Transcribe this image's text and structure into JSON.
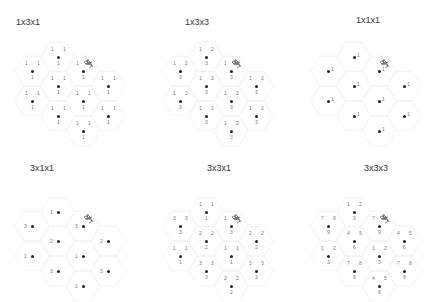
{
  "figure": {
    "panels": [
      {
        "id": "p1",
        "title": "1x3x1",
        "origin": [
          0,
          0
        ],
        "title_pos": [
          16,
          17
        ],
        "labels": [
          {
            "dot": 0,
            "top": [
              "1",
              "1"
            ],
            "bottom": [
              "1"
            ]
          },
          {
            "dot": 1,
            "top": [
              "1",
              "1"
            ],
            "bottom": [
              "1"
            ]
          },
          {
            "dot": 2,
            "top": [
              "1",
              "1"
            ],
            "bottom": [
              "1"
            ]
          },
          {
            "dot": 3,
            "top": [
              "1",
              "1"
            ],
            "bottom": [
              "1"
            ]
          },
          {
            "dot": 4,
            "top": [
              "1",
              "1"
            ],
            "bottom": [
              "1"
            ]
          },
          {
            "dot": 5,
            "top": [
              "1",
              "1"
            ],
            "bottom": [
              "1"
            ]
          },
          {
            "dot": 6,
            "top": [
              "1",
              "1"
            ],
            "bottom": [
              "1"
            ]
          },
          {
            "dot": 7,
            "top": [
              "1",
              "1"
            ],
            "bottom": [
              "1"
            ]
          },
          {
            "dot": 8,
            "top": [
              "1",
              "1"
            ],
            "bottom": [
              "1"
            ]
          },
          {
            "dot": 9,
            "top": [
              "1",
              "1"
            ],
            "bottom": [
              "1"
            ]
          }
        ]
      },
      {
        "id": "p2",
        "title": "1x3x3",
        "origin": [
          148,
          0
        ],
        "title_pos": [
          37,
          17
        ],
        "labels": [
          {
            "dot": 0,
            "top": [
              "1",
              "2"
            ],
            "bottom": [
              "3"
            ]
          },
          {
            "dot": 1,
            "top": [
              "1",
              "2"
            ],
            "bottom": [
              "3"
            ]
          },
          {
            "dot": 2,
            "top": [
              "1",
              "2"
            ],
            "bottom": [
              "3"
            ]
          },
          {
            "dot": 3,
            "top": [
              "1",
              "2"
            ],
            "bottom": [
              "3"
            ]
          },
          {
            "dot": 4,
            "top": [
              "1",
              "2"
            ],
            "bottom": [
              "3"
            ]
          },
          {
            "dot": 5,
            "top": [
              "1",
              "2"
            ],
            "bottom": [
              "3"
            ]
          },
          {
            "dot": 6,
            "top": [
              "1",
              "2"
            ],
            "bottom": [
              "3"
            ]
          },
          {
            "dot": 7,
            "top": [
              "1",
              "2"
            ],
            "bottom": [
              "3"
            ]
          },
          {
            "dot": 8,
            "top": [
              "1",
              "2"
            ],
            "bottom": [
              "3"
            ]
          },
          {
            "dot": 9,
            "top": [
              "1",
              "2"
            ],
            "bottom": [
              "3"
            ]
          }
        ]
      },
      {
        "id": "p3",
        "title": "1x1x1",
        "origin": [
          296,
          0
        ],
        "title_pos": [
          60,
          15
        ],
        "labels": [
          {
            "dot": 0,
            "side_right": "1"
          },
          {
            "dot": 1,
            "side_right": "1"
          },
          {
            "dot": 2,
            "side_right": "1"
          },
          {
            "dot": 3,
            "side_right": "1"
          },
          {
            "dot": 4,
            "side_right": "1"
          },
          {
            "dot": 5,
            "side_right": "1"
          },
          {
            "dot": 6,
            "side_right": "1"
          },
          {
            "dot": 7,
            "side_right": "1"
          },
          {
            "dot": 8,
            "side_right": "1"
          },
          {
            "dot": 9,
            "side_right": "1"
          }
        ]
      },
      {
        "id": "p4",
        "title": "3x1x1",
        "origin": [
          0,
          150
        ],
        "title_pos": [
          30,
          13
        ],
        "labels": [
          {
            "dot": 0,
            "side_left": "1"
          },
          {
            "dot": 1,
            "side_left": "3"
          },
          {
            "dot": 2,
            "side_left": "3"
          },
          {
            "dot": 3,
            "side_left": "2"
          },
          {
            "dot": 4,
            "side_left": "2"
          },
          {
            "dot": 5,
            "side_left": "1"
          },
          {
            "dot": 6,
            "side_left": "1"
          },
          {
            "dot": 7,
            "side_left": "3"
          },
          {
            "dot": 8,
            "side_left": "3"
          },
          {
            "dot": 9,
            "side_left": "2"
          }
        ]
      },
      {
        "id": "p5",
        "title": "3x3x1",
        "origin": [
          148,
          150
        ],
        "title_pos": [
          59,
          13
        ],
        "labels": [
          {
            "dot": 0,
            "top": [
              "1",
              "1"
            ],
            "bottom": [
              "1"
            ]
          },
          {
            "dot": 1,
            "top": [
              "3",
              "3"
            ],
            "bottom": [
              "3"
            ]
          },
          {
            "dot": 2,
            "top": [
              "1",
              "3"
            ],
            "bottom": [
              "3"
            ]
          },
          {
            "dot": 3,
            "top": [
              "2",
              "2"
            ],
            "bottom": [
              "2"
            ]
          },
          {
            "dot": 4,
            "top": [
              "2",
              "2"
            ],
            "bottom": [
              "2"
            ]
          },
          {
            "dot": 5,
            "top": [
              "1",
              "1"
            ],
            "bottom": [
              "1"
            ]
          },
          {
            "dot": 6,
            "top": [
              "1",
              "1"
            ],
            "bottom": [
              "1"
            ]
          },
          {
            "dot": 7,
            "top": [
              "3",
              "3"
            ],
            "bottom": [
              "3"
            ]
          },
          {
            "dot": 8,
            "top": [
              "3",
              "3"
            ],
            "bottom": [
              "3"
            ]
          },
          {
            "dot": 9,
            "top": [
              "2",
              "2"
            ],
            "bottom": [
              "2"
            ]
          }
        ]
      },
      {
        "id": "p6",
        "title": "3x3x3",
        "origin": [
          296,
          150
        ],
        "title_pos": [
          68,
          13
        ],
        "labels": [
          {
            "dot": 0,
            "top": [
              "1",
              "2"
            ],
            "bottom": [
              "3"
            ]
          },
          {
            "dot": 1,
            "top": [
              "7",
              "8"
            ],
            "bottom": [
              "9"
            ]
          },
          {
            "dot": 2,
            "top": [
              "7",
              "8"
            ],
            "bottom": [
              "9"
            ]
          },
          {
            "dot": 3,
            "top": [
              "4",
              "5"
            ],
            "bottom": [
              "6"
            ]
          },
          {
            "dot": 4,
            "top": [
              "4",
              "5"
            ],
            "bottom": [
              "6"
            ]
          },
          {
            "dot": 5,
            "top": [
              "1",
              "2"
            ],
            "bottom": [
              "3"
            ]
          },
          {
            "dot": 6,
            "top": [
              "1",
              "2"
            ],
            "bottom": [
              "3"
            ]
          },
          {
            "dot": 7,
            "top": [
              "7",
              "8"
            ],
            "bottom": [
              "9"
            ]
          },
          {
            "dot": 8,
            "top": [
              "7",
              "8"
            ],
            "bottom": [
              "9"
            ]
          },
          {
            "dot": 9,
            "top": [
              "4",
              "5"
            ],
            "bottom": [
              "6"
            ]
          }
        ]
      }
    ],
    "dot_positions": [
      [
        58,
        57
      ],
      [
        32,
        71
      ],
      [
        83,
        71
      ],
      [
        58,
        86
      ],
      [
        108,
        86
      ],
      [
        32,
        101
      ],
      [
        83,
        101
      ],
      [
        58,
        116
      ],
      [
        108,
        116
      ],
      [
        83,
        131
      ]
    ],
    "colors": {
      "dot": "#222222",
      "label": "#777777",
      "title": "#333333",
      "hex_outline": "#f0f0f0",
      "cluster": "#666666"
    }
  }
}
